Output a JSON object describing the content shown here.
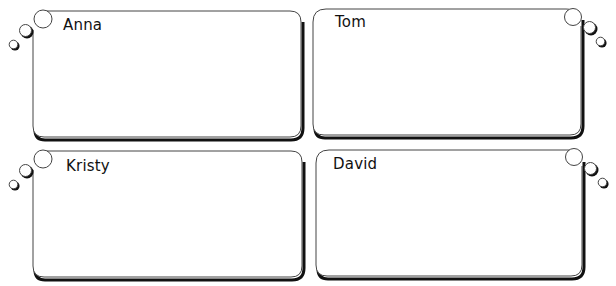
{
  "cards": [
    {
      "name": "Anna",
      "bubbles_side": "left"
    },
    {
      "name": "Tom",
      "bubbles_side": "right"
    },
    {
      "name": "Kristy",
      "bubbles_side": "left"
    },
    {
      "name": "David",
      "bubbles_side": "right"
    }
  ],
  "colors": {
    "outline": "#111111",
    "thin_outline": "#555555",
    "background": "#ffffff"
  }
}
